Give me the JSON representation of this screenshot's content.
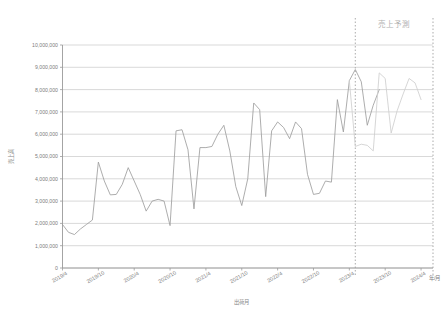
{
  "chart_data": {
    "type": "line",
    "title": "",
    "xlabel": "出荷月",
    "ylabel": "売上高",
    "x_axis_unit_label": "年/月",
    "ylim": [
      0,
      10000000
    ],
    "y_tick_values": [
      0,
      1000000,
      2000000,
      3000000,
      4000000,
      5000000,
      6000000,
      7000000,
      8000000,
      9000000,
      10000000
    ],
    "y_tick_labels": [
      "0",
      "1,000,000",
      "2,000,000",
      "3,000,000",
      "4,000,000",
      "5,000,000",
      "6,000,000",
      "7,000,000",
      "8,000,000",
      "9,000,000",
      "10,000,000"
    ],
    "x_tick_labels": [
      "2019/4",
      "2019/10",
      "2020/4",
      "2020/10",
      "2021/4",
      "2021/10",
      "2022/4",
      "2022/10",
      "2023/4",
      "2023/10",
      "2024/4"
    ],
    "x_tick_indices": [
      0,
      6,
      12,
      18,
      24,
      30,
      36,
      42,
      48,
      54,
      60
    ],
    "grid": true,
    "legend": "none",
    "annotations": [
      {
        "name": "forecast-region-caption",
        "text": "売上予測",
        "x_index": 54,
        "position": "top"
      }
    ],
    "dividers": [
      {
        "name": "forecast-start-divider",
        "x_index": 49,
        "style": "dotted"
      },
      {
        "name": "forecast-end-divider",
        "x_index": 62,
        "style": "dotted"
      }
    ],
    "series": [
      {
        "name": "売上高 (実績)",
        "kind": "actual",
        "color": "#9e9e9e",
        "x_start_index": 0,
        "values": [
          1950000,
          1600000,
          1500000,
          1750000,
          1950000,
          2150000,
          4750000,
          3900000,
          3280000,
          3300000,
          3750000,
          4500000,
          3900000,
          3300000,
          2550000,
          3000000,
          3080000,
          3000000,
          1900000,
          6150000,
          6200000,
          5300000,
          2650000,
          5400000,
          5400000,
          5450000,
          6000000,
          6400000,
          5250000,
          3650000,
          2800000,
          4000000,
          7400000,
          7100000,
          3200000,
          6150000,
          6550000,
          6300000,
          5800000,
          6550000,
          6250000,
          4200000,
          3300000,
          3350000,
          3900000,
          3850000,
          7550000,
          6100000,
          8400000,
          8900000,
          8350000,
          6400000,
          7300000,
          8000000
        ]
      },
      {
        "name": "売上高 (予測)",
        "kind": "forecast",
        "color": "#cfcfcf",
        "x_start_index": 48,
        "values": [
          8400000,
          5450000,
          5550000,
          5500000,
          5250000,
          8750000,
          8500000,
          6050000,
          7050000,
          7800000,
          8500000,
          8300000,
          7550000
        ]
      }
    ]
  },
  "ghost": {
    "top_left_fragment": ""
  }
}
